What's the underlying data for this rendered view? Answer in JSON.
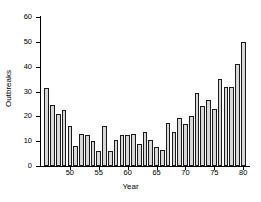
{
  "chart_data": {
    "type": "bar",
    "title": "",
    "xlabel": "Year",
    "ylabel": "Outbreaks",
    "xlim": [
      45,
      81
    ],
    "ylim": [
      0,
      60
    ],
    "grid": false,
    "legend": null,
    "ytick_labels": [
      "0",
      "10",
      "20",
      "30",
      "40",
      "50",
      "60"
    ],
    "ytick_values": [
      0,
      10,
      20,
      30,
      40,
      50,
      60
    ],
    "xtick_labels": [
      "50",
      "55",
      "60",
      "65",
      "70",
      "75",
      "80"
    ],
    "xtick_values": [
      50,
      55,
      60,
      65,
      70,
      75,
      80
    ],
    "categories": [
      "46",
      "47",
      "48",
      "49",
      "50",
      "51",
      "52",
      "53",
      "54",
      "55",
      "56",
      "57",
      "58",
      "59",
      "60",
      "61",
      "62",
      "63",
      "64",
      "65",
      "66",
      "67",
      "68",
      "69",
      "70",
      "71",
      "72",
      "73",
      "74",
      "75",
      "76",
      "77",
      "78",
      "79",
      "80"
    ],
    "values": [
      31.5,
      24.5,
      21,
      22.5,
      16,
      8,
      13,
      12.5,
      10,
      6,
      16,
      6,
      10.5,
      12.5,
      12.5,
      13,
      9,
      13.5,
      10.5,
      7.5,
      6.5,
      17.5,
      13.5,
      19.5,
      17,
      20,
      29.5,
      24,
      26.5,
      23,
      35,
      32,
      32,
      41,
      50
    ],
    "bar_color": "#d8d8d8",
    "bar_edge_color": "#1a1a1a",
    "axis_color": "#000000"
  }
}
